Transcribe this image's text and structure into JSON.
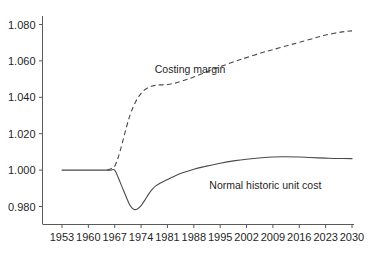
{
  "chart_data": {
    "type": "line",
    "title": "",
    "subtitle": "",
    "xlabel": "",
    "ylabel": "",
    "xlim": [
      1953,
      2030
    ],
    "ylim": [
      0.972,
      1.084
    ],
    "grid": false,
    "legend_position": "inline-annotations",
    "x_ticks": [
      "1953",
      "1960",
      "1967",
      "1974",
      "1981",
      "1988",
      "1995",
      "2002",
      "2009",
      "2016",
      "2023",
      "2030"
    ],
    "y_ticks": [
      "0.980",
      "1.000",
      "1.020",
      "1.040",
      "1.060",
      "1.080"
    ],
    "y_tick_values": [
      0.98,
      1.0,
      1.02,
      1.04,
      1.06,
      1.08
    ],
    "annotations": [
      {
        "id": "costing-margin-label",
        "text": "Costing margin",
        "x": 1987,
        "y": 1.0535
      },
      {
        "id": "normal-historic-unit-cost-label",
        "text": "Normal historic unit cost",
        "x": 2007,
        "y": 0.9895
      }
    ],
    "series": [
      {
        "name": "Normal historic unit cost",
        "style": "solid",
        "color": "#4a4a4a",
        "x": [
          1953,
          1956,
          1959,
          1962,
          1964,
          1965,
          1966,
          1967,
          1968,
          1969,
          1970,
          1971,
          1972,
          1973,
          1974,
          1975,
          1976,
          1977,
          1978,
          1979,
          1980,
          1981,
          1983,
          1985,
          1988,
          1991,
          1995,
          1999,
          2002,
          2006,
          2009,
          2012,
          2016,
          2019,
          2023,
          2026,
          2030
        ],
        "values": [
          1.0,
          1.0,
          1.0,
          1.0,
          1.0,
          1.0,
          1.0,
          1.0,
          0.9955,
          0.9905,
          0.9855,
          0.9808,
          0.9785,
          0.9786,
          0.9805,
          0.9835,
          0.9868,
          0.9895,
          0.9915,
          0.9928,
          0.9938,
          0.9948,
          0.9968,
          0.9985,
          1.0005,
          1.002,
          1.0038,
          1.0052,
          1.006,
          1.0068,
          1.0072,
          1.0073,
          1.0072,
          1.0069,
          1.0066,
          1.0064,
          1.0063
        ]
      },
      {
        "name": "Costing margin",
        "style": "dashed",
        "color": "#4a4a4a",
        "x": [
          1965,
          1966,
          1967,
          1968,
          1969,
          1970,
          1971,
          1972,
          1973,
          1974,
          1975,
          1976,
          1977,
          1978,
          1979,
          1981,
          1983,
          1985,
          1988,
          1992,
          1995,
          1999,
          2002,
          2006,
          2009,
          2013,
          2016,
          2020,
          2023,
          2027,
          2030
        ],
        "values": [
          1.0,
          1.0008,
          1.0022,
          1.0075,
          1.0148,
          1.0228,
          1.0298,
          1.0352,
          1.0392,
          1.0422,
          1.0442,
          1.0455,
          1.0462,
          1.0466,
          1.0468,
          1.047,
          1.0478,
          1.049,
          1.0512,
          1.0545,
          1.0568,
          1.0598,
          1.0618,
          1.0645,
          1.0662,
          1.0685,
          1.0702,
          1.0725,
          1.0742,
          1.0758,
          1.0765
        ]
      }
    ]
  },
  "axes": {
    "y_axis_name": "value-axis",
    "x_axis_name": "year-axis"
  }
}
